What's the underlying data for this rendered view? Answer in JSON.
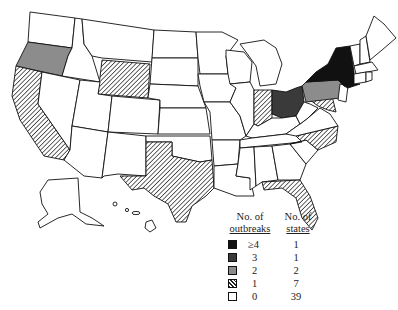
{
  "map": {
    "region": "United States",
    "fills": {
      "ge4": "#111111",
      "3": "#3a3a3a",
      "2": "#8c8c8c",
      "1": "hatch",
      "0": "#ffffff"
    },
    "state_categories": {
      "New York": "ge4",
      "Ohio": "3",
      "Oregon": "2",
      "Pennsylvania": "2",
      "California": "1",
      "Wyoming": "1",
      "Texas": "1",
      "Indiana": "1",
      "Maryland": "1",
      "North Carolina": "1",
      "Florida": "1"
    }
  },
  "legend": {
    "header_outbreaks_line1": "No. of",
    "header_outbreaks_line2": "outbreaks",
    "header_states_line1": "No. of",
    "header_states_line2": "states",
    "rows": [
      {
        "label": "≥4",
        "count": "1",
        "fill": "#111111"
      },
      {
        "label": "3",
        "count": "1",
        "fill": "#3a3a3a"
      },
      {
        "label": "2",
        "count": "2",
        "fill": "#8c8c8c"
      },
      {
        "label": "1",
        "count": "7",
        "fill": "hatch"
      },
      {
        "label": "0",
        "count": "39",
        "fill": "#ffffff"
      }
    ]
  }
}
